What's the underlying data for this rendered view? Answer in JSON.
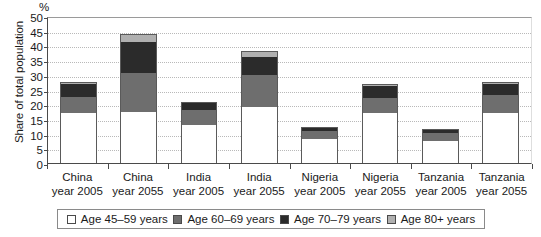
{
  "chart_data": {
    "type": "bar",
    "subtype": "stacked-vertical",
    "title": "",
    "xlabel": "",
    "ylabel": "Share of total population",
    "unit_label": "%",
    "ylim": [
      0,
      50
    ],
    "yticks": [
      0,
      5,
      10,
      15,
      20,
      25,
      30,
      35,
      40,
      45,
      50
    ],
    "grid": true,
    "legend_position": "bottom",
    "categories": [
      "China year 2005",
      "China year 2055",
      "India year 2005",
      "India year 2055",
      "Nigeria year 2005",
      "Nigeria year 2055",
      "Tanzania year 2005",
      "Tanzania year 2055"
    ],
    "category_lines": [
      {
        "l1": "China",
        "l2": "year 2005"
      },
      {
        "l1": "China",
        "l2": "year 2055"
      },
      {
        "l1": "India",
        "l2": "year 2005"
      },
      {
        "l1": "India",
        "l2": "year 2055"
      },
      {
        "l1": "Nigeria",
        "l2": "year 2005"
      },
      {
        "l1": "Nigeria",
        "l2": "year 2055"
      },
      {
        "l1": "Tanzania",
        "l2": "year 2005"
      },
      {
        "l1": "Tanzania",
        "l2": "year 2055"
      }
    ],
    "series": [
      {
        "name": "Age 45–59 years",
        "color": "#ffffff",
        "values": [
          17.0,
          17.5,
          13.0,
          19.0,
          8.0,
          17.0,
          7.5,
          17.0
        ]
      },
      {
        "name": "Age 60–69 years",
        "color": "#6e6e6e",
        "values": [
          5.5,
          13.0,
          5.0,
          11.0,
          2.8,
          5.0,
          2.8,
          6.0
        ]
      },
      {
        "name": "Age 70–79 years",
        "color": "#2b2b2b",
        "values": [
          4.3,
          10.5,
          2.3,
          6.0,
          1.0,
          4.3,
          1.0,
          3.8
        ]
      },
      {
        "name": "Age 80+ years",
        "color": "#b0b0b0",
        "values": [
          0.7,
          3.0,
          0.4,
          2.0,
          0.3,
          0.7,
          0.3,
          0.7
        ]
      }
    ],
    "totals": [
      27.5,
      44.0,
      20.7,
      38.0,
      12.1,
      27.0,
      11.6,
      27.5
    ]
  },
  "legend": {
    "items": [
      {
        "label": "Age 45–59 years",
        "color": "#ffffff"
      },
      {
        "label": "Age 60–69 years",
        "color": "#6e6e6e"
      },
      {
        "label": "Age 70–79 years",
        "color": "#2b2b2b"
      },
      {
        "label": "Age 80+ years",
        "color": "#b0b0b0"
      }
    ]
  },
  "colors": {
    "axis": "#4a4a4a",
    "grid": "#b9b9b9",
    "background": "#ffffff",
    "text": "#1a1a1a"
  }
}
